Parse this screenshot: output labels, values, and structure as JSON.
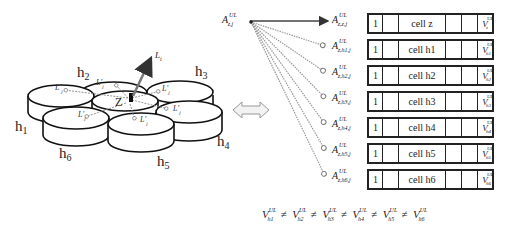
{
  "diagram": {
    "cluster": {
      "center_label": "Z",
      "neighbor_labels": [
        "h1",
        "h2",
        "h3",
        "h4",
        "h5",
        "h6"
      ],
      "beam_label": "L_i",
      "link_labels": [
        "L'j",
        "L'j",
        "L'j",
        "L'j",
        "L'j",
        "L'j"
      ]
    },
    "equivalence_arrow": "double-headed-arrow",
    "source_label": {
      "base": "A",
      "sup": "UL",
      "sub": "z,j"
    },
    "targets": [
      {
        "base": "A",
        "sup": "UL",
        "sub": "z,z,j",
        "col1": "1",
        "cell": "cell z",
        "v_sub": "z",
        "line": "solid"
      },
      {
        "base": "A",
        "sup": "UL",
        "sub": "z,h1,j",
        "col1": "1",
        "cell": "cell h1",
        "v_sub": "h1",
        "line": "dashed"
      },
      {
        "base": "A",
        "sup": "UL",
        "sub": "z,h2,j",
        "col1": "1",
        "cell": "cell h2",
        "v_sub": "h2",
        "line": "dashed"
      },
      {
        "base": "A",
        "sup": "UL",
        "sub": "z,h3,j",
        "col1": "1",
        "cell": "cell h3",
        "v_sub": "h3",
        "line": "dashed"
      },
      {
        "base": "A",
        "sup": "UL",
        "sub": "z,h4,j",
        "col1": "1",
        "cell": "cell h4",
        "v_sub": "h4",
        "line": "dashed"
      },
      {
        "base": "A",
        "sup": "UL",
        "sub": "z,h5,j",
        "col1": "1",
        "cell": "cell h5",
        "v_sub": "h5",
        "line": "dashed"
      },
      {
        "base": "A",
        "sup": "UL",
        "sub": "z,h6,j",
        "col1": "1",
        "cell": "cell h6",
        "v_sub": "h6",
        "line": "dashed"
      }
    ],
    "formula": {
      "terms": [
        {
          "base": "V",
          "sup": "UL",
          "sub": "h1"
        },
        {
          "base": "V",
          "sup": "UL",
          "sub": "h2"
        },
        {
          "base": "V",
          "sup": "UL",
          "sub": "h3"
        },
        {
          "base": "V",
          "sup": "UL",
          "sub": "h4"
        },
        {
          "base": "V",
          "sup": "UL",
          "sub": "h5"
        },
        {
          "base": "V",
          "sup": "UL",
          "sub": "h6"
        }
      ],
      "operator": "≠"
    }
  }
}
